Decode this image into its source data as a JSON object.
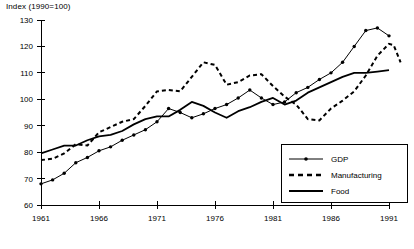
{
  "chart_data": {
    "type": "line",
    "title": "",
    "ylabel": "Index (1990=100)",
    "xlabel": "",
    "ylim": [
      60,
      130
    ],
    "xlim": [
      1961,
      1991
    ],
    "grid": false,
    "legend_position": "bottom-right",
    "y_ticks": [
      60,
      70,
      80,
      90,
      100,
      110,
      120,
      130
    ],
    "x_ticks": [
      1961,
      1966,
      1971,
      1976,
      1981,
      1986,
      1991
    ],
    "x": [
      1961,
      1962,
      1963,
      1964,
      1965,
      1966,
      1967,
      1968,
      1969,
      1970,
      1971,
      1972,
      1973,
      1974,
      1975,
      1976,
      1977,
      1978,
      1979,
      1980,
      1981,
      1982,
      1983,
      1984,
      1985,
      1986,
      1987,
      1988,
      1989,
      1990,
      1991
    ],
    "series": [
      {
        "name": "GDP",
        "style": "line-markers",
        "values": [
          68,
          69.5,
          72,
          76,
          78,
          80.5,
          82,
          84.5,
          86.5,
          88.5,
          91.5,
          96.5,
          95,
          93,
          94.5,
          96.5,
          98,
          100.5,
          103.5,
          100.5,
          98,
          99,
          102.5,
          104.5,
          107.5,
          110,
          114,
          120,
          126,
          127,
          124
        ]
      },
      {
        "name": "Manufacturing",
        "style": "dashed",
        "values": [
          77,
          77.5,
          79.5,
          83,
          82.5,
          87.5,
          89.5,
          91.5,
          92.5,
          97.5,
          103,
          103.5,
          103,
          108.5,
          114,
          113,
          105.5,
          106.5,
          109,
          109.5,
          105,
          101,
          98,
          92.5,
          92,
          96.5,
          99.5,
          103,
          109,
          116.5,
          121
        ]
      },
      {
        "name": "Food",
        "style": "solid",
        "values": [
          79.5,
          81,
          82.5,
          82.5,
          84.5,
          86,
          86.5,
          88,
          90.5,
          92.5,
          93.5,
          93.5,
          96,
          99,
          97.5,
          95,
          93,
          95.5,
          97,
          99,
          100.5,
          98,
          99.5,
          102.5,
          104.5,
          106.5,
          108.5,
          110,
          110,
          110.5,
          111
        ]
      }
    ],
    "manufacturing_extra": {
      "note": "Manufacturing declines after 1990 peak",
      "tail_values": [
        120.5,
        114
      ]
    }
  },
  "legend": {
    "items": [
      {
        "label": "GDP",
        "marker": "line-with-dots"
      },
      {
        "label": "Manufacturing",
        "marker": "dashed-line"
      },
      {
        "label": "Food",
        "marker": "solid-line"
      }
    ]
  },
  "colors": {
    "ink": "#000000",
    "background": "#ffffff"
  }
}
